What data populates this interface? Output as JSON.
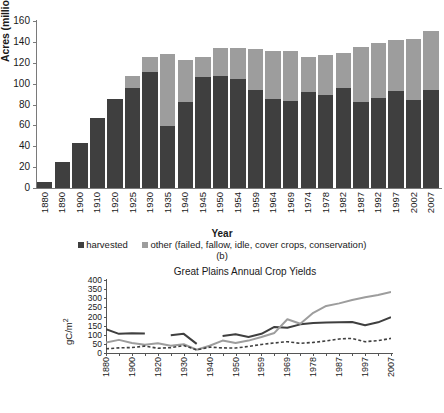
{
  "bar_chart": {
    "ylabel": "Acres (millions)",
    "xlabel": "Year",
    "subcaption": "(b)",
    "legend": {
      "harvested": "harvested",
      "other": "other (failed, fallow, idle, cover crops, conservation)"
    },
    "colors": {
      "harvested": "#3f3f3f",
      "other": "#9d9d9d"
    }
  },
  "line_chart": {
    "title": "Great Plains Annual Crop Yields",
    "ylabel": "gC/m",
    "ylabel_sup": "2"
  },
  "chart_data": [
    {
      "type": "bar",
      "id": "great-plains-cropland-area",
      "title": "",
      "subcaption": "(b)",
      "xlabel": "Year",
      "ylabel": "Acres (millions)",
      "ylim": [
        0,
        160
      ],
      "yticks": [
        0,
        20,
        40,
        60,
        80,
        100,
        120,
        140,
        160
      ],
      "grid": false,
      "stacked": true,
      "legend_position": "bottom",
      "categories": [
        "1880",
        "1890",
        "1900",
        "1910",
        "1920",
        "1925",
        "1930",
        "1935",
        "1940",
        "1945",
        "1950",
        "1954",
        "1959",
        "1964",
        "1969",
        "1974",
        "1978",
        "1982",
        "1987",
        "1992",
        "1997",
        "2002",
        "2007"
      ],
      "series": [
        {
          "name": "harvested",
          "color": "#3f3f3f",
          "values": [
            6,
            25,
            43,
            67,
            85,
            96,
            111,
            59,
            82,
            106,
            107,
            104,
            94,
            85,
            83,
            92,
            89,
            96,
            82,
            86,
            93,
            84,
            94
          ]
        },
        {
          "name": "other (failed, fallow, idle, cover crops, conservation)",
          "color": "#9d9d9d",
          "values": [
            0,
            0,
            0,
            0,
            0,
            11,
            15,
            69,
            41,
            20,
            27,
            30,
            39,
            46,
            48,
            34,
            38,
            33,
            53,
            53,
            49,
            59,
            56
          ]
        }
      ],
      "totals": [
        6,
        25,
        43,
        67,
        85,
        107,
        126,
        128,
        123,
        126,
        134,
        134,
        133,
        131,
        131,
        126,
        127,
        129,
        135,
        139,
        142,
        143,
        150
      ]
    },
    {
      "type": "line",
      "id": "great-plains-annual-crop-yields",
      "title": "Great Plains Annual Crop Yields",
      "xlabel": "",
      "ylabel": "gC/m2",
      "ylim": [
        0,
        400
      ],
      "yticks": [
        0,
        50,
        100,
        150,
        200,
        250,
        300,
        350,
        400
      ],
      "grid": false,
      "x": [
        "1880",
        "1890",
        "1900",
        "1910",
        "1920",
        "1925",
        "1930",
        "1935",
        "1940",
        "1945",
        "1950",
        "1954",
        "1959",
        "1964",
        "1969",
        "1974",
        "1978",
        "1982",
        "1987",
        "1992",
        "1997",
        "2002",
        "2007"
      ],
      "xtick_labels": [
        "1880",
        "1900",
        "1920",
        "1930",
        "1940",
        "1950",
        "1959",
        "1969",
        "1978",
        "1987",
        "1997",
        "2007"
      ],
      "series": [
        {
          "name": "dark-solid",
          "color": "#3f3f3f",
          "style": "solid",
          "gaps": true,
          "values": [
            130,
            105,
            108,
            107,
            null,
            97,
            105,
            50,
            null,
            93,
            103,
            88,
            105,
            143,
            138,
            157,
            165,
            167,
            168,
            170,
            152,
            168,
            196
          ]
        },
        {
          "name": "gray-solid",
          "color": "#9d9d9d",
          "style": "solid",
          "gaps": false,
          "values": [
            57,
            72,
            55,
            45,
            53,
            40,
            48,
            18,
            40,
            68,
            55,
            68,
            88,
            110,
            185,
            160,
            220,
            258,
            272,
            290,
            305,
            318,
            335
          ]
        },
        {
          "name": "dark-dashed",
          "color": "#3f3f3f",
          "style": "dashed",
          "gaps": false,
          "values": [
            23,
            28,
            30,
            38,
            26,
            29,
            41,
            17,
            32,
            28,
            27,
            36,
            47,
            55,
            62,
            53,
            58,
            66,
            77,
            80,
            62,
            68,
            80
          ]
        }
      ]
    }
  ]
}
